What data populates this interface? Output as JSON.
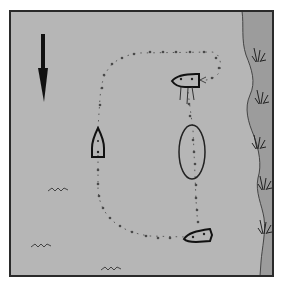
{
  "diagram": {
    "type": "boating-maneuver-illustration",
    "colors": {
      "background": "#ffffff",
      "frame": "#2a2a2a",
      "water": "#b4b4b4",
      "shore": "#9a9a9a",
      "shoreline": "#444444",
      "ink": "#222222",
      "path": "#555555",
      "reeds": "#333333"
    },
    "elements": {
      "current_arrow": {
        "icon": "arrow-down-icon",
        "direction": "down"
      },
      "course_path": {
        "style": "dotted-arrowed"
      },
      "boats": [
        {
          "id": "boat-top",
          "orientation": "left",
          "label": ""
        },
        {
          "id": "boat-left",
          "orientation": "up",
          "label": ""
        },
        {
          "id": "boat-bottom",
          "orientation": "left",
          "label": ""
        }
      ],
      "buoy_oval": {
        "shape": "ellipse"
      },
      "waves": [
        {
          "id": "wave-1"
        },
        {
          "id": "wave-2"
        },
        {
          "id": "wave-3"
        }
      ],
      "reeds_count": 5
    }
  }
}
